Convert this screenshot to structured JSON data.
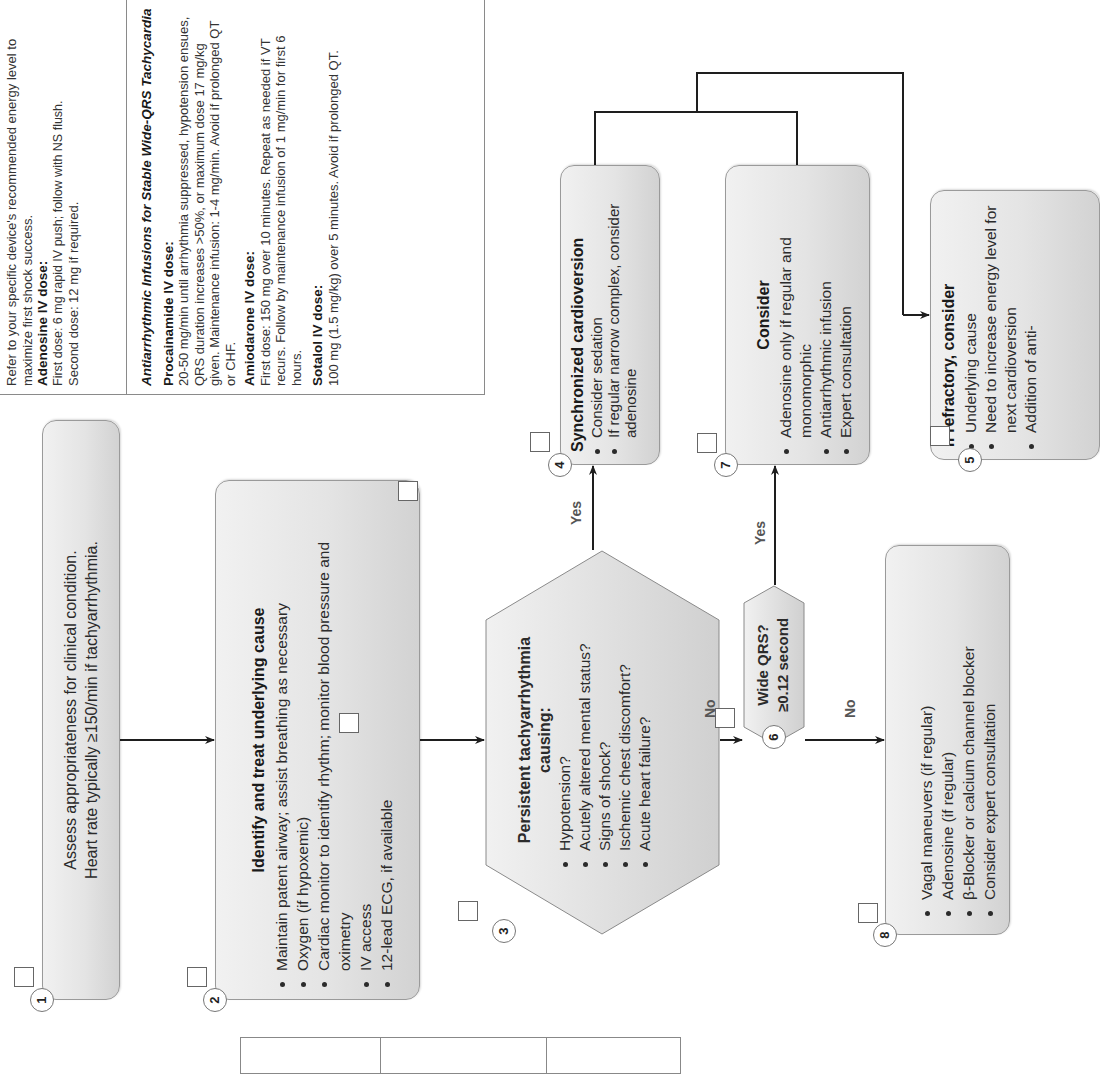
{
  "info_box": {
    "intro": "Refer to your specific device's recommended energy level to maximize first shock success.",
    "adenosine": {
      "heading": "Adenosine IV dose:",
      "lines": [
        "First dose: 6 mg rapid IV push; follow with NS flush.",
        "Second dose: 12 mg if required."
      ]
    },
    "infusions_heading": "Antiarrhythmic Infusions for Stable Wide-QRS Tachycardia",
    "procainamide": {
      "heading": "Procainamide IV dose:",
      "text": "20-50 mg/min until arrhythmia suppressed, hypotension ensues, QRS duration increases >50%, or maximum dose 17 mg/kg given. Maintenance infusion: 1-4 mg/min. Avoid if prolonged QT or CHF."
    },
    "amiodarone": {
      "heading": "Amiodarone IV dose:",
      "text": "First dose: 150 mg over 10 minutes. Repeat as needed if VT recurs. Follow by maintenance infusion of 1 mg/min for first 6 hours."
    },
    "sotalol": {
      "heading": "Sotalol IV dose:",
      "text": "100 mg (1.5 mg/kg) over 5 minutes. Avoid if prolonged QT."
    }
  },
  "steps": {
    "s1": {
      "number": "1",
      "lines": [
        "Assess appropriateness for clinical condition.",
        "Heart rate typically ≥150/min if tachyarrhythmia."
      ]
    },
    "s2": {
      "number": "2",
      "title": "Identify and treat underlying cause",
      "items": [
        "Maintain patent airway; assist breathing as necessary",
        "Oxygen (if hypoxemic)",
        "Cardiac monitor to identify rhythm; monitor blood pressure and oximetry",
        "IV access",
        "12-lead ECG, if available"
      ]
    },
    "s3": {
      "number": "3",
      "title": "Persistent tachyarrhythmia causing:",
      "items": [
        "Hypotension?",
        "Acutely altered mental status?",
        "Signs of shock?",
        "Ischemic chest discomfort?",
        "Acute heart failure?"
      ]
    },
    "s4": {
      "number": "4",
      "title": "Synchronized cardioversion",
      "items": [
        "Consider sedation",
        "If regular narrow complex, consider adenosine"
      ]
    },
    "s5": {
      "number": "5",
      "title": "If refractory, consider",
      "items": [
        "Underlying cause",
        "Need to increase energy level for next cardioversion",
        "Addition of anti-"
      ]
    },
    "s6": {
      "number": "6",
      "lines": [
        "Wide QRS?",
        "≥0.12 second"
      ]
    },
    "s7": {
      "number": "7",
      "title": "Consider",
      "items": [
        "Adenosine only if regular and monomorphic",
        "Antiarrhythmic infusion",
        "Expert consultation"
      ]
    },
    "s8": {
      "number": "8",
      "items": [
        "Vagal maneuvers (if regular)",
        "Adenosine (if regular)",
        "β-Blocker or calcium channel blocker",
        "Consider expert consultation"
      ]
    }
  },
  "edge_labels": {
    "s3_yes": "Yes",
    "s3_no": "No",
    "s6_yes": "Yes",
    "s6_no": "No"
  },
  "colors": {
    "box_fill_top": "#f1f1f1",
    "box_fill_bottom": "#d2d2d2",
    "line": "#1e1e1e",
    "label": "#555555"
  }
}
